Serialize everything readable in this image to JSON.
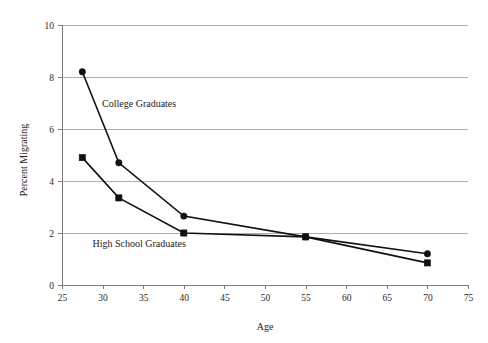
{
  "chart_data": {
    "type": "line",
    "title": "",
    "xlabel": "Age",
    "ylabel": "Percent Migrating",
    "xlim": [
      25,
      75
    ],
    "ylim": [
      0,
      10
    ],
    "xticks": [
      25,
      30,
      35,
      40,
      45,
      50,
      55,
      60,
      65,
      70,
      75
    ],
    "yticks": [
      0,
      2,
      4,
      6,
      8,
      10
    ],
    "grid": "horizontal",
    "legend_position": "inline-annotations",
    "series": [
      {
        "name": "College Graduates",
        "marker": "circle",
        "x": [
          27.5,
          32,
          40,
          55,
          70
        ],
        "values": [
          8.2,
          4.7,
          2.65,
          1.85,
          1.2
        ]
      },
      {
        "name": "High School Graduates",
        "marker": "square",
        "x": [
          27.5,
          32,
          40,
          55,
          70
        ],
        "values": [
          4.9,
          3.35,
          2.0,
          1.85,
          0.85
        ]
      }
    ],
    "annotations": [
      {
        "text": "College Graduates",
        "x": 34.5,
        "y": 6.85
      },
      {
        "text": "High School Graduates",
        "x": 34.5,
        "y": 1.45
      }
    ],
    "colors": {
      "line": "#111111",
      "grid": "#aeaeae",
      "axis": "#7c7c7c",
      "text": "#1a1a1a",
      "background": "#ffffff"
    }
  },
  "axis": {
    "x_label": "Age",
    "y_label": "Percent Migrating",
    "x_ticks": [
      "25",
      "30",
      "35",
      "40",
      "45",
      "50",
      "55",
      "60",
      "65",
      "70",
      "75"
    ],
    "y_ticks": [
      "0",
      "2",
      "4",
      "6",
      "8",
      "10"
    ]
  },
  "labels": {
    "college": "College Graduates",
    "high_school": "High School Graduates"
  }
}
